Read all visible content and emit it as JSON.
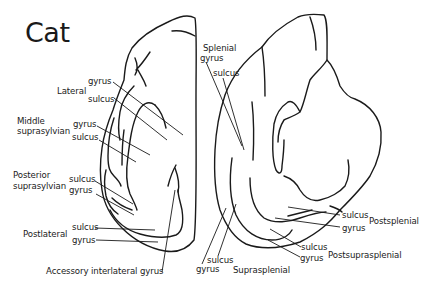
{
  "title": "Cat",
  "left_hemisphere": {
    "labels": {
      "lateral_group": "Lateral",
      "lateral_gyrus": "gyrus",
      "lateral_sulcus": "sulcus",
      "middle_supra_group_line1": "Middle",
      "middle_supra_group_line2": "suprasylvian",
      "middle_supra_gyrus": "gyrus",
      "middle_supra_sulcus": "sulcus",
      "posterior_supra_group_line1": "Posterior",
      "posterior_supra_group_line2": "suprasylvian",
      "posterior_supra_sulcus": "sulcus",
      "posterior_supra_gyrus": "gyrus",
      "postlateral_group": "Postlateral",
      "postlateral_sulcus": "sulcus",
      "postlateral_gyrus": "gyrus",
      "accessory_interlateral": "Accessory interlateral gyrus"
    }
  },
  "right_hemisphere": {
    "labels": {
      "splenial_group": "Splenial",
      "splenial_gyrus": "gyrus",
      "splenial_sulcus": "sulcus",
      "postsplenial_sulcus": "sulcus",
      "postsplenial_gyrus": "gyrus",
      "postsplenial_group": "Postsplenial",
      "postsuprasplenial_sulcus": "sulcus",
      "postsuprasplenial_gyrus": "gyrus",
      "postsuprasplenial_group": "Postsuprasplenial",
      "suprasplenial_sulcus": "sulcus",
      "suprasplenial_gyrus": "gyrus",
      "suprasplenial_group": "Suprasplenial"
    }
  }
}
